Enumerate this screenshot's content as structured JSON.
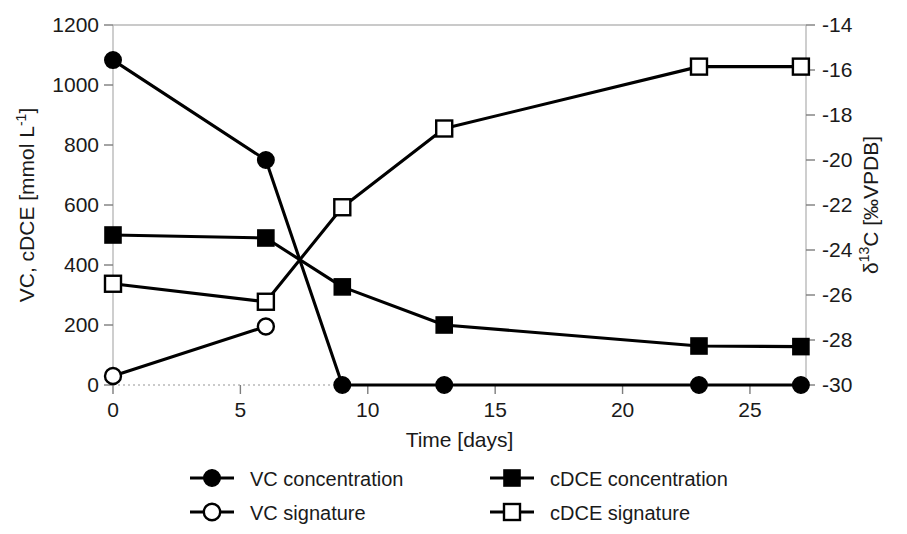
{
  "chart_data": {
    "type": "line",
    "title": "",
    "xlabel": "Time [days]",
    "ylabel": "VC, cDCE [mmol L-1]",
    "ylabel_rich": {
      "pre": "VC, cDCE [mmol L",
      "sup": "-1",
      "post": "]"
    },
    "y2label": "δ13C [‰VPDB]",
    "y2label_rich": {
      "delta": "δ",
      "sup": "13",
      "post": "C [‰VPDB]"
    },
    "xlim": [
      0,
      27.2
    ],
    "ylim": [
      0,
      1200
    ],
    "y2lim": [
      -30,
      -14
    ],
    "xticks": [
      0,
      5,
      10,
      15,
      20,
      25
    ],
    "xtick_labels": [
      "0",
      "5",
      "10",
      "15",
      "20",
      "25"
    ],
    "yticks": [
      0,
      200,
      400,
      600,
      800,
      1000,
      1200
    ],
    "ytick_labels": [
      "0",
      "200",
      "400",
      "600",
      "800",
      "1000",
      "1200"
    ],
    "y2ticks": [
      -30,
      -28,
      -26,
      -24,
      -22,
      -20,
      -18,
      -16,
      -14
    ],
    "y2tick_labels": [
      "-30",
      "-28",
      "-26",
      "-24",
      "-22",
      "-20",
      "-18",
      "-16",
      "-14"
    ],
    "grid": false,
    "legend_position": "bottom",
    "series": [
      {
        "name": "VC concentration",
        "axis": "left",
        "marker": "filled-circle",
        "x": [
          0,
          6,
          9,
          13,
          23,
          27
        ],
        "values": [
          1083,
          750,
          0,
          0,
          0,
          0
        ]
      },
      {
        "name": "cDCE concentration",
        "axis": "left",
        "marker": "filled-square",
        "x": [
          0,
          6,
          9,
          13,
          23,
          27
        ],
        "values": [
          500,
          490,
          327,
          200,
          130,
          128
        ]
      },
      {
        "name": "VC signature",
        "axis": "right",
        "marker": "open-circle",
        "x": [
          0,
          6
        ],
        "values": [
          -29.6,
          -27.4
        ]
      },
      {
        "name": "cDCE signature",
        "axis": "right",
        "marker": "open-square",
        "x": [
          0,
          6,
          9,
          13,
          23,
          27
        ],
        "values": [
          -25.5,
          -26.3,
          -22.1,
          -18.6,
          -15.85,
          -15.85
        ]
      }
    ],
    "legend": [
      {
        "label": "VC concentration",
        "marker": "filled-circle"
      },
      {
        "label": "cDCE concentration",
        "marker": "filled-square"
      },
      {
        "label": "VC signature",
        "marker": "open-circle"
      },
      {
        "label": "cDCE signature",
        "marker": "open-square"
      }
    ]
  }
}
